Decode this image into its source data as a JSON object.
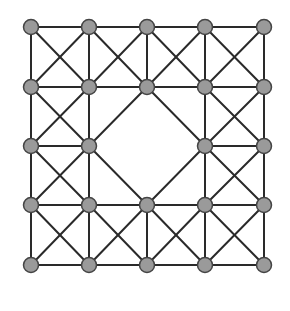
{
  "diagram": {
    "type": "graph",
    "colors": {
      "background": "#ffffff",
      "edge": "#2a2a2a",
      "node_fill": "#9a9a9a",
      "node_stroke": "#444444"
    },
    "node_radius": 7.5,
    "grid": {
      "columns_x": [
        31,
        89,
        147,
        205,
        264
      ],
      "rows_y": [
        27,
        87,
        146,
        205,
        265
      ]
    },
    "nodes": [
      {
        "id": "r0c0",
        "r": 0,
        "c": 0
      },
      {
        "id": "r0c1",
        "r": 0,
        "c": 1
      },
      {
        "id": "r0c2",
        "r": 0,
        "c": 2
      },
      {
        "id": "r0c3",
        "r": 0,
        "c": 3
      },
      {
        "id": "r0c4",
        "r": 0,
        "c": 4
      },
      {
        "id": "r1c0",
        "r": 1,
        "c": 0
      },
      {
        "id": "r1c1",
        "r": 1,
        "c": 1
      },
      {
        "id": "r1c2",
        "r": 1,
        "c": 2
      },
      {
        "id": "r1c3",
        "r": 1,
        "c": 3
      },
      {
        "id": "r1c4",
        "r": 1,
        "c": 4
      },
      {
        "id": "r2c0",
        "r": 2,
        "c": 0
      },
      {
        "id": "r2c1",
        "r": 2,
        "c": 1
      },
      {
        "id": "r2c3",
        "r": 2,
        "c": 3
      },
      {
        "id": "r2c4",
        "r": 2,
        "c": 4
      },
      {
        "id": "r3c0",
        "r": 3,
        "c": 0
      },
      {
        "id": "r3c1",
        "r": 3,
        "c": 1
      },
      {
        "id": "r3c2",
        "r": 3,
        "c": 2
      },
      {
        "id": "r3c3",
        "r": 3,
        "c": 3
      },
      {
        "id": "r3c4",
        "r": 3,
        "c": 4
      },
      {
        "id": "r4c0",
        "r": 4,
        "c": 0
      },
      {
        "id": "r4c1",
        "r": 4,
        "c": 1
      },
      {
        "id": "r4c2",
        "r": 4,
        "c": 2
      },
      {
        "id": "r4c3",
        "r": 4,
        "c": 3
      },
      {
        "id": "r4c4",
        "r": 4,
        "c": 4
      }
    ],
    "removed_nodes": [
      "r2c2"
    ],
    "cells_with_both_diagonals": [
      [
        0,
        0
      ],
      [
        0,
        1
      ],
      [
        0,
        2
      ],
      [
        0,
        3
      ],
      [
        1,
        0
      ],
      [
        1,
        3
      ],
      [
        2,
        0
      ],
      [
        2,
        3
      ],
      [
        3,
        0
      ],
      [
        3,
        1
      ],
      [
        3,
        2
      ],
      [
        3,
        3
      ]
    ],
    "diamond_edges": [
      [
        "r1c2",
        "r2c1"
      ],
      [
        "r2c1",
        "r3c2"
      ],
      [
        "r3c2",
        "r2c3"
      ],
      [
        "r2c3",
        "r1c2"
      ]
    ]
  }
}
